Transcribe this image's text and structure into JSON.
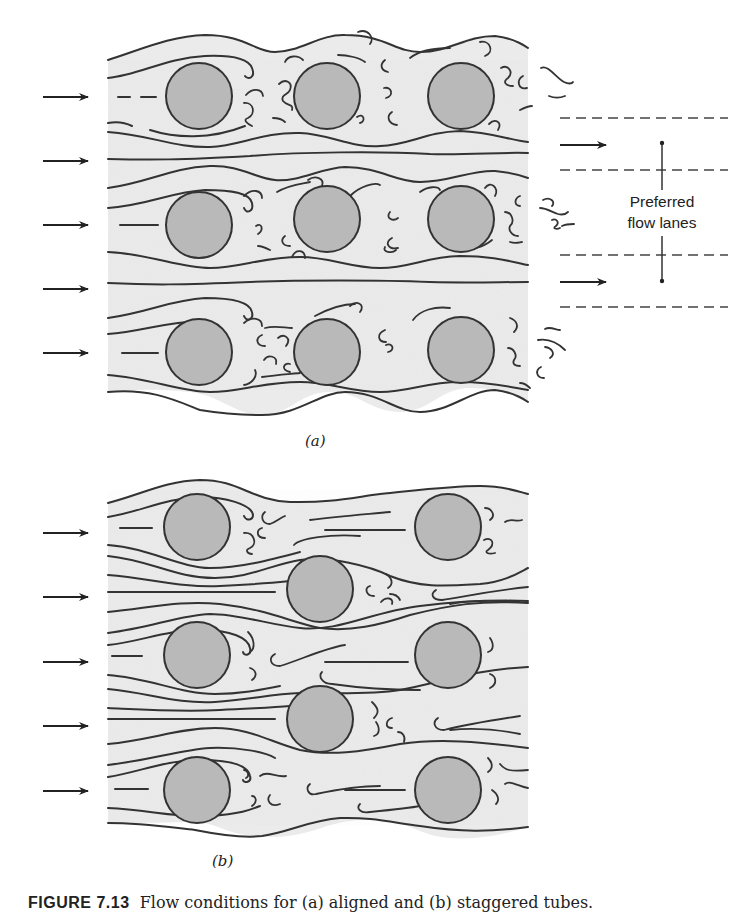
{
  "figure": {
    "caption_label": "FIGURE 7.13",
    "caption_text": "Flow conditions for (a) aligned and (b) staggered tubes.",
    "panels": [
      {
        "id": "a",
        "label": "(a)",
        "arrangement": "aligned",
        "tube_rows": 3,
        "tube_columns": 3,
        "inlet_arrows": 5,
        "annotation": {
          "text_line1": "Preferred",
          "text_line2": "flow lanes",
          "lane_arrows": 2
        }
      },
      {
        "id": "b",
        "label": "(b)",
        "arrangement": "staggered",
        "tube_rows": 5,
        "tube_columns": 3,
        "inlet_arrows": 5
      }
    ],
    "colors": {
      "flow_field": "#ebebeb",
      "tube_fill": "#b9b9b9",
      "line": "#333333"
    }
  }
}
